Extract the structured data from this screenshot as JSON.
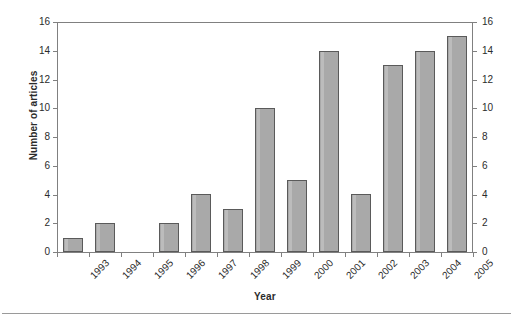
{
  "chart_data": {
    "type": "bar",
    "title": "",
    "subtitle": "",
    "xlabel": "Year",
    "ylabel": "Number of articles",
    "categories": [
      "1993",
      "1994",
      "1995",
      "1996",
      "1997",
      "1998",
      "1999",
      "2000",
      "2001",
      "2002",
      "2003",
      "2004",
      "2005"
    ],
    "values": [
      1,
      2,
      0,
      2,
      4,
      3,
      10,
      5,
      14,
      4,
      13,
      14,
      15
    ],
    "ylim": [
      0,
      16
    ],
    "ytick_step": 2,
    "yticks": [
      "0",
      "2",
      "4",
      "6",
      "8",
      "10",
      "12",
      "14",
      "16"
    ],
    "yticks_right": [
      "0",
      "2",
      "4",
      "6",
      "8",
      "10",
      "12",
      "14",
      "16"
    ],
    "grid": false,
    "legend": null,
    "legend_position": "none",
    "annotations": [],
    "bar_color": "#a9a9a9",
    "bar_border_color": "#5a5a5a",
    "axis_color": "#808080",
    "text_color": "#2b2b2b",
    "dual_axis": true,
    "xtick_label_rotation": -45
  },
  "axes": {
    "y_title": "Number of articles",
    "x_title": "Year"
  }
}
